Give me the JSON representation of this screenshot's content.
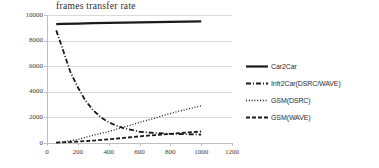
{
  "chart_data": {
    "type": "line",
    "title": "frames transfer rate",
    "xlabel": "",
    "ylabel": "",
    "xlim": [
      0,
      1200
    ],
    "ylim": [
      0,
      10000
    ],
    "grid": true,
    "legend_position": "right",
    "x_ticks": [
      "0",
      "200",
      "400",
      "600",
      "800",
      "1000",
      "1200"
    ],
    "x_tick_values": [
      0,
      200,
      400,
      600,
      800,
      1000,
      1200
    ],
    "y_ticks": [
      "0",
      "2000",
      "4000",
      "6000",
      "8000",
      "10000"
    ],
    "y_tick_values": [
      0,
      2000,
      4000,
      6000,
      8000,
      10000
    ],
    "series": [
      {
        "name": "Car2Car",
        "style": "solid",
        "color": "#1a1a1a",
        "x": [
          60,
          100,
          200,
          300,
          400,
          500,
          600,
          700,
          800,
          900,
          1000
        ],
        "values": [
          9280,
          9300,
          9330,
          9360,
          9390,
          9410,
          9430,
          9450,
          9470,
          9490,
          9500
        ]
      },
      {
        "name": "Infr2Car(DSRC/WAVE)",
        "style": "dash-dot",
        "color": "#1a1a1a",
        "x": [
          60,
          100,
          150,
          200,
          250,
          300,
          350,
          400,
          450,
          500,
          600,
          700,
          800,
          900,
          1000
        ],
        "values": [
          8800,
          7400,
          5600,
          4350,
          3300,
          2550,
          2000,
          1620,
          1350,
          1150,
          880,
          780,
          720,
          690,
          660
        ]
      },
      {
        "name": "GSM(DSRC)",
        "style": "dotted",
        "color": "#1a1a1a",
        "x": [
          60,
          100,
          200,
          300,
          400,
          500,
          600,
          700,
          800,
          900,
          1000
        ],
        "values": [
          40,
          80,
          280,
          600,
          900,
          1250,
          1600,
          1950,
          2300,
          2620,
          2900
        ]
      },
      {
        "name": "GSM(WAVE)",
        "style": "dashed",
        "color": "#1a1a1a",
        "x": [
          60,
          100,
          200,
          300,
          400,
          500,
          600,
          700,
          800,
          900,
          1000
        ],
        "values": [
          30,
          50,
          110,
          190,
          290,
          400,
          520,
          620,
          710,
          810,
          900
        ]
      }
    ]
  }
}
